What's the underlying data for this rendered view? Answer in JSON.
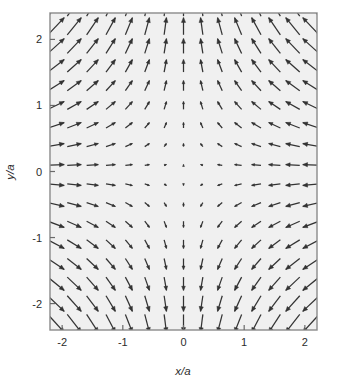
{
  "figure": {
    "title": "",
    "background_color": "#ffffff",
    "plot_background_color": "#f0f0f0",
    "frame_color": "#808080",
    "arrow_color": "#333333"
  },
  "axes": {
    "x_label": "x/a",
    "y_label": "y/a",
    "x_ticks": [
      "-2",
      "-1",
      "0",
      "1",
      "2"
    ],
    "y_ticks": [
      "2",
      "1",
      "0",
      "-1",
      "-2"
    ]
  },
  "chart_data": {
    "type": "quiver",
    "title": "",
    "xlabel": "x/a",
    "ylabel": "y/a",
    "xlim": [
      -2.2,
      2.2
    ],
    "ylim": [
      -2.4,
      2.4
    ],
    "xticks": [
      -2,
      -1,
      0,
      1,
      2
    ],
    "yticks": [
      -2,
      -1,
      0,
      1,
      2
    ],
    "grid": false,
    "legend": "none",
    "field_description": "Saddle-point (quadrupole) vector field: arrows point inward along the x-axis and outward along the y-axis.",
    "field_formula": "F = (-x, y)",
    "grid_nx": 15,
    "grid_ny": 17,
    "x_start": -2.1,
    "x_step": 0.3,
    "y_start": -2.3,
    "y_step": 0.3,
    "arrow_scale": 26,
    "components": {
      "u": "-x",
      "v": "y"
    },
    "sample_points": [
      {
        "x": -2.1,
        "y": 2.3,
        "u": 2.1,
        "v": 2.3
      },
      {
        "x": 0.0,
        "y": 2.3,
        "u": 0.0,
        "v": 2.3
      },
      {
        "x": 2.1,
        "y": 2.3,
        "u": -2.1,
        "v": 2.3
      },
      {
        "x": -2.1,
        "y": 0.0,
        "u": 2.1,
        "v": 0.0
      },
      {
        "x": 0.0,
        "y": 0.0,
        "u": 0.0,
        "v": 0.0
      },
      {
        "x": 2.1,
        "y": 0.0,
        "u": -2.1,
        "v": 0.0
      },
      {
        "x": -2.1,
        "y": -2.3,
        "u": 2.1,
        "v": -2.3
      },
      {
        "x": 0.0,
        "y": -2.3,
        "u": 0.0,
        "v": -2.3
      },
      {
        "x": 2.1,
        "y": -2.3,
        "u": -2.1,
        "v": -2.3
      }
    ]
  }
}
